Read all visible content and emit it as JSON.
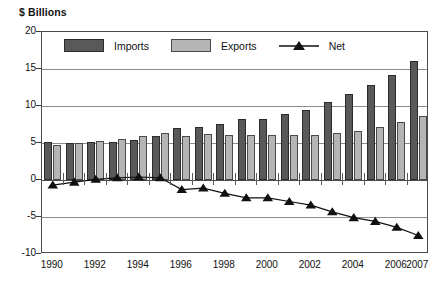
{
  "chart_data": {
    "type": "bar",
    "title": "$ Billions",
    "xlabel": "",
    "ylabel": "$ Billions",
    "ylim": [
      -10,
      20
    ],
    "yticks": [
      20,
      15,
      10,
      5,
      0,
      -5,
      -10
    ],
    "ytick_labels": [
      "20",
      "15",
      "10",
      "5",
      "0",
      "-5",
      "-10"
    ],
    "grid": true,
    "legend_position": "top-left-inside",
    "categories": [
      "1990",
      "1991",
      "1992",
      "1993",
      "1994",
      "1995",
      "1996",
      "1997",
      "1998",
      "1999",
      "2000",
      "2001",
      "2002",
      "2003",
      "2004",
      "2005",
      "2006",
      "2007"
    ],
    "xtick_labels": [
      "1990",
      "1992",
      "1994",
      "1996",
      "1998",
      "2000",
      "2002",
      "2004",
      "2006",
      "2007"
    ],
    "series": [
      {
        "name": "Imports",
        "type": "bar",
        "color": "#595959",
        "values": [
          5.2,
          5.0,
          5.1,
          5.1,
          5.4,
          6.0,
          7.0,
          7.1,
          7.6,
          8.3,
          8.3,
          8.9,
          9.4,
          10.5,
          11.6,
          12.8,
          14.2,
          16.1
        ]
      },
      {
        "name": "Exports",
        "type": "bar",
        "color": "#b5b5b5",
        "values": [
          4.7,
          5.0,
          5.3,
          5.5,
          6.0,
          6.4,
          5.9,
          6.2,
          6.1,
          6.1,
          6.1,
          6.1,
          6.1,
          6.3,
          6.6,
          7.1,
          7.9,
          8.6
        ]
      },
      {
        "name": "Net",
        "type": "line",
        "color": "#111111",
        "marker": "triangle",
        "values": [
          -0.7,
          -0.3,
          0.1,
          0.3,
          0.4,
          0.3,
          -1.3,
          -1.1,
          -1.8,
          -2.4,
          -2.4,
          -2.9,
          -3.4,
          -4.3,
          -5.1,
          -5.6,
          -6.4,
          -7.5
        ]
      }
    ],
    "legend": [
      {
        "label": "Imports",
        "swatch": "dark-gray-rect"
      },
      {
        "label": "Exports",
        "swatch": "light-gray-rect"
      },
      {
        "label": "Net",
        "swatch": "line-with-triangle-marker"
      }
    ]
  }
}
